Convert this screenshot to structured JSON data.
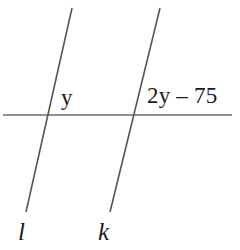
{
  "figure": {
    "kind": "geometry-diagram",
    "background_color": "#ffffff",
    "stroke_color": "#555555",
    "text_color": "#1a1a1a"
  },
  "labels": {
    "angle_left": "y",
    "angle_right": "2y – 75",
    "line_left": "l",
    "line_right": "k"
  },
  "chart_data": {
    "type": "diagram",
    "title": "",
    "xlabel": "",
    "ylabel": "",
    "viewbox": [
      0,
      0,
      240,
      250
    ],
    "elements": [
      {
        "name": "horizontal-transversal",
        "kind": "line",
        "x1": 3,
        "y1": 115,
        "x2": 232,
        "y2": 115,
        "stroke": "#6b6b6b",
        "stroke_width": 1.6
      },
      {
        "name": "line-l",
        "kind": "line",
        "label": "l",
        "x1": 72,
        "y1": 8,
        "x2": 26,
        "y2": 212,
        "stroke": "#555555",
        "stroke_width": 1.6
      },
      {
        "name": "line-k",
        "kind": "line",
        "label": "k",
        "x1": 160,
        "y1": 8,
        "x2": 110,
        "y2": 212,
        "stroke": "#555555",
        "stroke_width": 1.6
      }
    ],
    "intersections": [
      {
        "name": "l-with-horizontal",
        "x": 48,
        "y": 115
      },
      {
        "name": "k-with-horizontal",
        "x": 134,
        "y": 115
      }
    ],
    "annotations": [
      {
        "name": "angle-y",
        "text": "y",
        "x": 61,
        "y": 86,
        "at_intersection": "l-with-horizontal",
        "position": "above-right"
      },
      {
        "name": "angle-2y-minus-75",
        "text": "2y – 75",
        "x": 147,
        "y": 84,
        "at_intersection": "k-with-horizontal",
        "position": "above-right"
      },
      {
        "name": "line-label-l",
        "text": "l",
        "x": 18,
        "y": 219,
        "style": "italic"
      },
      {
        "name": "line-label-k",
        "text": "k",
        "x": 98,
        "y": 219,
        "style": "italic"
      }
    ]
  }
}
